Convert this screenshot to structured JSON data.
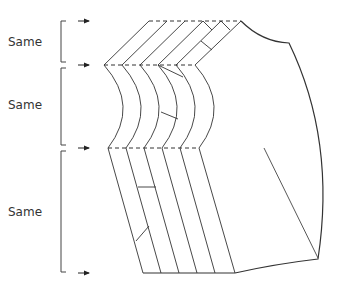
{
  "diagram": {
    "title": "",
    "labels": [
      {
        "text": "Same",
        "x": 8,
        "y": 35
      },
      {
        "text": "Same",
        "x": 8,
        "y": 98
      },
      {
        "text": "Same",
        "x": 8,
        "y": 205
      }
    ],
    "levels_y": [
      21,
      65,
      148,
      273
    ],
    "strip_edges": {
      "top_x": [
        149,
        167,
        185,
        203,
        221,
        241
      ],
      "mid_x": [
        104,
        122,
        140,
        158,
        176,
        195
      ],
      "low_x": [
        108,
        126,
        144,
        162,
        180,
        199
      ],
      "bottom_x": [
        143,
        161,
        179,
        197,
        215,
        235
      ]
    },
    "colors": {
      "line": "#333333",
      "background": "#ffffff"
    }
  }
}
